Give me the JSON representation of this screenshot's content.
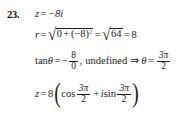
{
  "problem": {
    "number": "23.",
    "topic": "complex-number-polar-form"
  },
  "line1": {
    "variable": "z",
    "equals": "=",
    "value": "−8i",
    "full": "z = −8i"
  },
  "line2": {
    "variable": "r",
    "equals": "=",
    "radical_sign": "√",
    "radicand_a": "0",
    "plus": "+",
    "radicand_b": "(−8)",
    "exponent": "2",
    "equals2": "=",
    "radical_sign2": "√",
    "radicand2": "64",
    "equals3": "=",
    "result": "8",
    "full": "r = √(0 + (−8)²) = √64 = 8"
  },
  "line3": {
    "tan_label": "tan",
    "theta": "θ",
    "equals": "=",
    "minus": "−",
    "numerator": "8",
    "denominator": "0",
    "comma": ",",
    "undefined_label": "undefined",
    "implies": "⇒",
    "theta2": "θ",
    "equals2": "=",
    "result_num": "3π",
    "result_den": "2",
    "full": "tan θ = −8/0, undefined ⇒ θ = 3π/2"
  },
  "line4": {
    "variable": "z",
    "equals": "=",
    "modulus": "8",
    "paren_open": "(",
    "cos_label": "cos",
    "cos_num": "3π",
    "cos_den": "2",
    "plus": "+",
    "i_label": "i",
    "sin_label": "sin",
    "sin_num": "3π",
    "sin_den": "2",
    "paren_close": ")",
    "full": "z = 8(cos 3π/2 + i sin 3π/2)"
  },
  "colors": {
    "background": "#ffffff",
    "text": "#1a1a1a",
    "faint": "#6a6a6a"
  }
}
